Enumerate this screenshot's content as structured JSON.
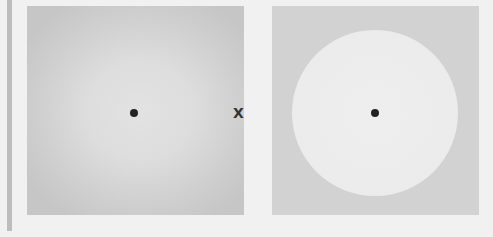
{
  "figure": {
    "left_panel": {
      "description": "blurred gray square with lighter diffuse center",
      "fixation_dot": "dot"
    },
    "separator_mark": "X",
    "right_panel": {
      "description": "gray square with sharp light disc",
      "fixation_dot": "dot"
    }
  },
  "colors": {
    "background": "#f1f1f1",
    "panel_gray": "#d2d2d2",
    "disc_light": "#ececec",
    "dot": "#222222"
  }
}
